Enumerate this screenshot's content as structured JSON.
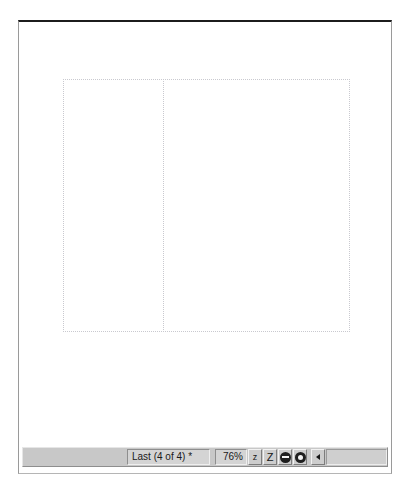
{
  "window": {
    "title": "Print Preview"
  },
  "preview": {
    "page_left_label": "",
    "page_right_label": ""
  },
  "status_bar": {
    "navigation_label": "Last (4 of 4) *",
    "zoom_value": "76%",
    "zoom_out_label": "z",
    "zoom_in_label": "Z",
    "zoom_out_disc_name": "zoom-out-disc",
    "zoom_in_disc_name": "zoom-in-disc",
    "scroll_left_label": "",
    "colors": {
      "face": "#c8c8c8",
      "well": "#d4d4d4",
      "text": "#1a1a1a",
      "glyph": "#1f1f1f"
    }
  }
}
